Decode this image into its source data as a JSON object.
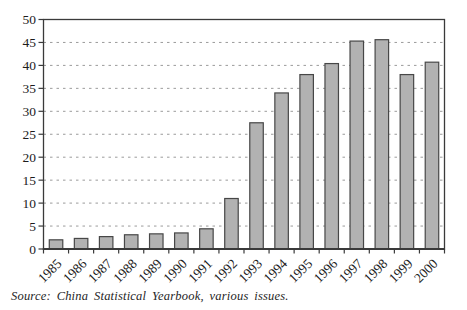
{
  "figure": {
    "source_note": "Source: China Statistical Yearbook, various issues."
  },
  "chart_data": {
    "type": "bar",
    "title": "",
    "xlabel": "",
    "ylabel": "",
    "categories": [
      "1985",
      "1986",
      "1987",
      "1988",
      "1989",
      "1990",
      "1991",
      "1992",
      "1993",
      "1994",
      "1995",
      "1996",
      "1997",
      "1998",
      "1999",
      "2000"
    ],
    "values": [
      2.0,
      2.3,
      2.7,
      3.1,
      3.3,
      3.5,
      4.4,
      11.0,
      27.5,
      34.0,
      38.0,
      40.4,
      45.3,
      45.6,
      38.0,
      40.7
    ],
    "ylim": [
      0,
      50
    ],
    "ytick_step": 5,
    "yticks": [
      0,
      5,
      10,
      15,
      20,
      25,
      30,
      35,
      40,
      45,
      50
    ],
    "grid": "horizontal-dashed",
    "legend": "none",
    "x_label_rotation_deg": -45,
    "colors": {
      "bar_fill": "#b2b2b2",
      "bar_stroke": "#474747",
      "grid_color": "#9b9b9b",
      "axis_color": "#3a3a3a",
      "text_color": "#1c1c1c",
      "background": "#ffffff"
    }
  }
}
